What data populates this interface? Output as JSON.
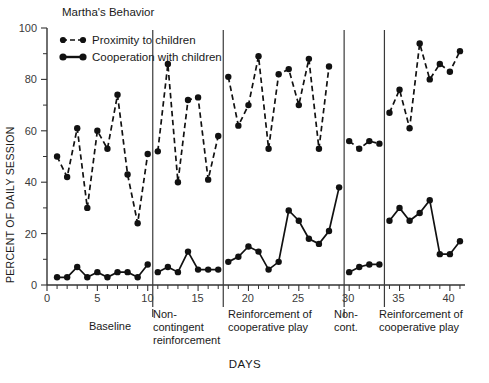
{
  "chart_data": {
    "type": "line",
    "title": "Martha's Behavior",
    "xlabel": "DAYS",
    "ylabel": "PERCENT OF DAILY SESSION",
    "xlim": [
      0,
      41.5
    ],
    "ylim": [
      0,
      100
    ],
    "grid": false,
    "legend_position": "top-left",
    "x_ticks_major": [
      0,
      5,
      10,
      15,
      20,
      25,
      30,
      35,
      40
    ],
    "x_tick_labels": [
      "0",
      "5",
      "10",
      "15",
      "20",
      "25",
      "30",
      "35",
      "40"
    ],
    "y_ticks_major": [
      0,
      20,
      40,
      60,
      80,
      100
    ],
    "y_tick_labels": [
      "0",
      "20",
      "40",
      "60",
      "80",
      "100"
    ],
    "y_ticks_minor": [
      10,
      30,
      50,
      70,
      90
    ],
    "x": [
      1,
      2,
      3,
      4,
      5,
      6,
      7,
      8,
      9,
      10,
      11,
      12,
      13,
      14,
      15,
      16,
      17,
      18,
      19,
      20,
      21,
      22,
      23,
      24,
      25,
      26,
      27,
      28,
      29,
      30,
      31,
      32,
      33,
      34,
      35,
      36,
      37,
      38,
      39,
      40,
      41
    ],
    "series": [
      {
        "name": "Proximity to children",
        "style": "dashed",
        "marker": "filled-circle",
        "values": [
          50,
          42,
          61,
          30,
          60,
          53,
          74,
          43,
          24,
          51,
          52,
          86,
          40,
          72,
          73,
          41,
          58,
          81,
          62,
          70,
          89,
          53,
          82,
          84,
          70,
          88,
          53,
          85,
          null,
          56,
          53,
          56,
          55,
          67,
          76,
          61,
          94,
          80,
          86,
          83,
          91
        ]
      },
      {
        "name": "Cooperation with children",
        "style": "solid",
        "marker": "filled-circle",
        "values": [
          3,
          3,
          7,
          3,
          5,
          3,
          5,
          5,
          3,
          8,
          5,
          7,
          5,
          13,
          6,
          6,
          6,
          9,
          11,
          15,
          13,
          6,
          9,
          29,
          25,
          18,
          16,
          21,
          38,
          5,
          7,
          8,
          8,
          25,
          30,
          25,
          28,
          33,
          12,
          12,
          17
        ]
      }
    ],
    "phases": [
      {
        "label": "Baseline",
        "start": 0.0,
        "end": 10.5
      },
      {
        "label": "Non-\ncontingent\nreinforcement",
        "start": 10.5,
        "end": 17.5
      },
      {
        "label": "Reinforcement of\ncooperative play",
        "start": 17.5,
        "end": 29.5
      },
      {
        "label": "Non-\ncont.",
        "start": 29.5,
        "end": 33.5
      },
      {
        "label": "Reinforcement of\ncooperative play",
        "start": 33.5,
        "end": 41.5
      }
    ],
    "phase_dividers": [
      10.5,
      17.5,
      29.5,
      33.5
    ],
    "colors": {
      "series": "#111111",
      "axis": "#333333",
      "text": "#1a1a1a"
    }
  },
  "chart": {
    "title": "Martha's Behavior",
    "y_axis_title": "PERCENT OF DAILY SESSION",
    "x_axis_title": "DAYS",
    "legend": [
      {
        "label": "Proximity to children",
        "style": "dashed"
      },
      {
        "label": "Cooperation with children",
        "style": "solid"
      }
    ],
    "phase_labels": {
      "baseline": "Baseline",
      "noncontingent_l1": "Non-",
      "noncontingent_l2": "contingent",
      "noncontingent_l3": "reinforcement",
      "reinforce1_l1": "Reinforcement of",
      "reinforce1_l2": "cooperative play",
      "noncont2_l1": "Non-",
      "noncont2_l2": "cont.",
      "reinforce2_l1": "Reinforcement of",
      "reinforce2_l2": "cooperative play"
    },
    "y_tick_labels": [
      "100",
      "80",
      "60",
      "40",
      "20",
      "0"
    ],
    "x_tick_labels": [
      "0",
      "5",
      "10",
      "15",
      "20",
      "25",
      "30",
      "35",
      "40"
    ]
  }
}
